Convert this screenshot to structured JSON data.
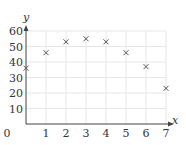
{
  "chart_data": {
    "type": "scatter",
    "title": "",
    "xlabel": "x",
    "ylabel": "y",
    "x": [
      0,
      1,
      2,
      3,
      4,
      5,
      6,
      7
    ],
    "values": [
      36,
      46,
      53,
      55,
      53,
      46,
      37,
      23
    ],
    "marker": "x",
    "xlim": [
      0,
      7
    ],
    "ylim": [
      0,
      60
    ],
    "x_ticks": [
      "0",
      "1",
      "2",
      "3",
      "4",
      "5",
      "6",
      "7"
    ],
    "y_ticks": [
      "10",
      "20",
      "30",
      "40",
      "50",
      "60"
    ],
    "grid": true,
    "legend": null
  },
  "colors": {
    "grid": "#e6e6e6",
    "axis": "#444444",
    "marker": "#555555",
    "text": "#333333"
  }
}
